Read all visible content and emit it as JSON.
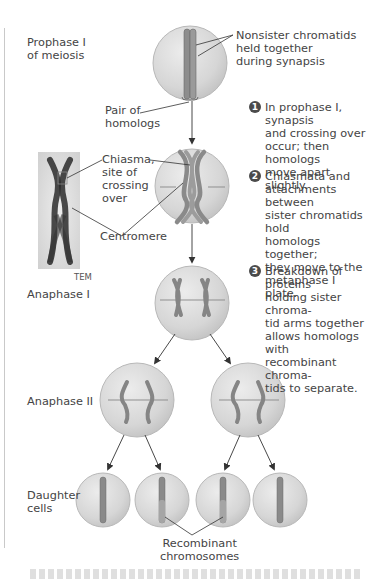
{
  "figure": {
    "stages": {
      "prophase": "Prophase I\nof meiosis",
      "anaphase1": "Anaphase I",
      "anaphase2": "Anaphase II",
      "daughter": "Daughter\ncells"
    },
    "labels": {
      "nonsister": "Nonsister chromatids\nheld together\nduring synapsis",
      "pair": "Pair of\nhomologs",
      "chiasma": "Chiasma,\nsite of\ncrossing\nover",
      "centromere": "Centromere",
      "tem": "TEM",
      "recombinant": "Recombinant\nchromosomes"
    },
    "steps": [
      {
        "number": "1",
        "text": "In prophase I, synapsis\nand crossing over\noccur; then homologs\nmove apart slightly."
      },
      {
        "number": "2",
        "text": "Chiasmata and\nattachments between\nsister chromatids hold\nhomologs together;\nthey move to the\nmetaphase I plate."
      },
      {
        "number": "3",
        "text": "Breakdown of proteins\nholding sister chroma-\ntid arms together\nallows homologs with\nrecombinant chroma-\ntids to separate."
      }
    ],
    "colors": {
      "cell_fill": "#d9d9d9",
      "cell_edge": "#b5b5b5",
      "chromosome": "#8a8a8a",
      "chromosome_dark": "#5e5e5e",
      "arrow": "#333333",
      "badge": "#4b4b4b"
    }
  }
}
